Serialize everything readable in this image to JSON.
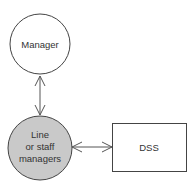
{
  "diagram": {
    "nodes": [
      {
        "id": "manager",
        "shape": "circle",
        "lines": [
          "Manager"
        ],
        "fill": "#ffffff"
      },
      {
        "id": "line_staff",
        "shape": "circle",
        "lines": [
          "Line",
          "or staff",
          "managers"
        ],
        "fill": "#c9c9c9"
      },
      {
        "id": "dss",
        "shape": "rectangle",
        "lines": [
          "DSS"
        ],
        "fill": "#ffffff"
      }
    ],
    "edges": [
      {
        "from": "manager",
        "to": "line_staff",
        "direction": "bidirectional"
      },
      {
        "from": "line_staff",
        "to": "dss",
        "direction": "bidirectional"
      }
    ],
    "stroke_color": "#444444"
  }
}
